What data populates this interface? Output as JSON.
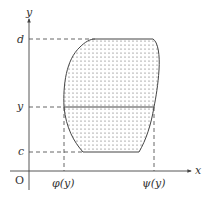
{
  "figure": {
    "axes": {
      "x_label": "x",
      "y_label": "y",
      "origin_label": "O"
    },
    "levels": {
      "d": "d",
      "y": "y",
      "c": "c"
    },
    "bounds": {
      "phi": "φ(y)",
      "psi": "ψ(y)"
    },
    "region": {
      "description": "Dotted region bounded by x = φ(y) on the left and x = ψ(y) on the right, between y = c and y = d, with horizontal strip at height y",
      "fill": "dotted",
      "stroke_color": "#444444"
    }
  }
}
